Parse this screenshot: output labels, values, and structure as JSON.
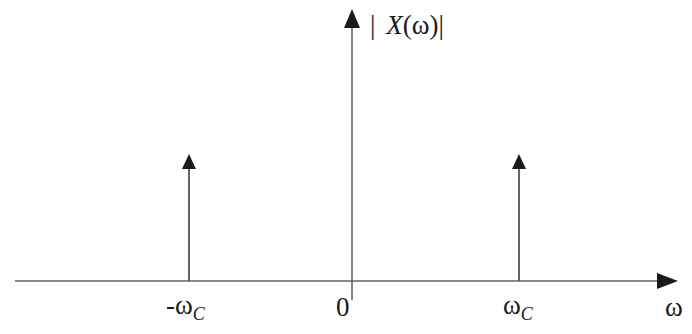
{
  "diagram": {
    "type": "frequency-spectrum-impulses",
    "y_axis_label": "| X(ω)|",
    "y_axis_label_parts": {
      "bar_left": "|",
      "symbol": "X",
      "arg": "(ω)",
      "bar_right": "|"
    },
    "x_axis_label": "ω",
    "origin_label": "0",
    "impulses": [
      {
        "name": "negative-cutoff",
        "label_main": "-ω",
        "label_sub": "C",
        "x": -1,
        "height": 1
      },
      {
        "name": "positive-cutoff",
        "label_main": "ω",
        "label_sub": "C",
        "x": 1,
        "height": 1
      }
    ],
    "colors": {
      "axis": "#555555",
      "arrow": "#1a1a1a",
      "text": "#1a1a1a",
      "background": "#ffffff"
    }
  }
}
